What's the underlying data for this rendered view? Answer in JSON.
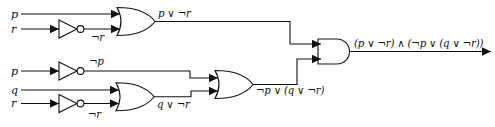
{
  "diagram": {
    "type": "combinational-logic-circuit",
    "expression": "(p ∨ ¬r) ∧ (¬p ∨ (q ∨ ¬r))",
    "colors": {
      "background": "#ffffff",
      "line": "#111111"
    },
    "inputs": [
      {
        "label": "p"
      },
      {
        "label": "r"
      },
      {
        "label": "p"
      },
      {
        "label": "q"
      },
      {
        "label": "r"
      }
    ],
    "wire_labels": {
      "not_r_top": "¬r",
      "or1_out": "p ∨ ¬r",
      "not_p": "¬p",
      "not_r_bottom": "¬r",
      "or2_out": "q ∨ ¬r",
      "or3_out": "¬p ∨ (q ∨ ¬r)",
      "and_out": "(p ∨ ¬r) ∧ (¬p ∨ (q ∨ ¬r))"
    },
    "gates": [
      {
        "id": "not1",
        "type": "NOT",
        "inputs": [
          "r"
        ],
        "output": "¬r"
      },
      {
        "id": "or1",
        "type": "OR",
        "inputs": [
          "p",
          "¬r"
        ],
        "output": "p ∨ ¬r"
      },
      {
        "id": "not2",
        "type": "NOT",
        "inputs": [
          "p"
        ],
        "output": "¬p"
      },
      {
        "id": "not3",
        "type": "NOT",
        "inputs": [
          "r"
        ],
        "output": "¬r"
      },
      {
        "id": "or2",
        "type": "OR",
        "inputs": [
          "q",
          "¬r"
        ],
        "output": "q ∨ ¬r"
      },
      {
        "id": "or3",
        "type": "OR",
        "inputs": [
          "¬p",
          "q ∨ ¬r"
        ],
        "output": "¬p ∨ (q ∨ ¬r)"
      },
      {
        "id": "and1",
        "type": "AND",
        "inputs": [
          "p ∨ ¬r",
          "¬p ∨ (q ∨ ¬r)"
        ],
        "output": "(p ∨ ¬r) ∧ (¬p ∨ (q ∨ ¬r))"
      }
    ]
  }
}
